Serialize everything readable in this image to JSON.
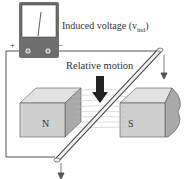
{
  "figure": {
    "meter_label": "Induced voltage (v",
    "meter_label_sub": "ind",
    "meter_label_close": ")",
    "motion_label": "Relative motion",
    "north_pole": "N",
    "south_pole": "S",
    "plus_terminal": "+",
    "minus_terminal": "−"
  },
  "colors": {
    "meter_body": "#6e6e6e",
    "meter_face": "#ffffff",
    "magnet_face": "#cfcfcf",
    "magnet_side": "#a9a9a9",
    "magnet_top": "#e2e2e2",
    "wire": "#555555",
    "field_lines": "#bdbdbd",
    "motion_arrow": "#222222"
  }
}
